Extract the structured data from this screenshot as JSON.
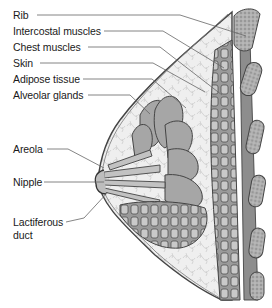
{
  "diagram": {
    "labels": [
      {
        "id": "rib",
        "text": "Rib"
      },
      {
        "id": "intercostal",
        "text": "Intercostal muscles"
      },
      {
        "id": "chest",
        "text": "Chest muscles"
      },
      {
        "id": "skin",
        "text": "Skin"
      },
      {
        "id": "adipose",
        "text": "Adipose tissue"
      },
      {
        "id": "alveolar",
        "text": "Alveolar glands"
      },
      {
        "id": "areola",
        "text": "Areola"
      },
      {
        "id": "nipple",
        "text": "Nipple"
      },
      {
        "id": "lactiferous_1",
        "text": "Lactiferous"
      },
      {
        "id": "lactiferous_2",
        "text": "duct"
      }
    ],
    "colors": {
      "line": "#555555",
      "gland_fill": "#a8a8a8",
      "gland_dark": "#8a8a8a",
      "adipose_fill": "#ececec",
      "muscle_fill": "#8f8f8f",
      "rib_fill": "#b5b5b5"
    }
  }
}
